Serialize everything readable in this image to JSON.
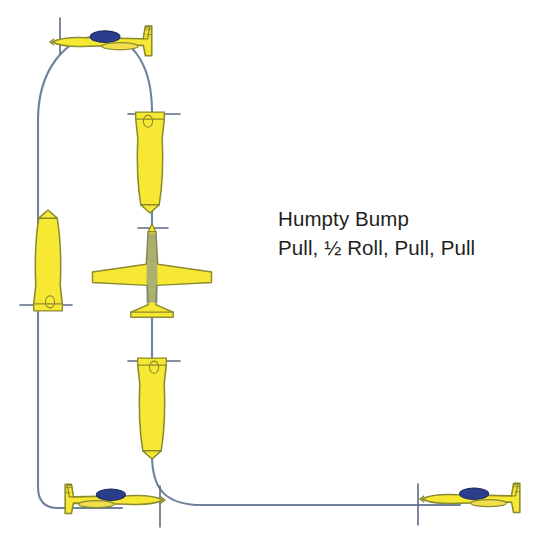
{
  "figure": {
    "colors": {
      "aircraft_body": "#F7E833",
      "aircraft_outline": "#8A8A2E",
      "canopy": "#2B3E8C",
      "flight_path": "#6E82A0",
      "tick_mark": "#5A6B84",
      "text": "#231f20",
      "background": "#ffffff"
    }
  },
  "caption": {
    "line1": "Humpty Bump",
    "line2": "Pull, ½ Roll, Pull, Pull"
  },
  "maneuver": {
    "name": "Humpty Bump",
    "sequence": [
      "Pull",
      "½ Roll",
      "Pull",
      "Pull"
    ],
    "elements": 4
  },
  "aircraft": [
    {
      "id": "entry-bottom-left",
      "position": "bottom-left",
      "attitude": "upright-level",
      "heading": "right",
      "label": "entry level flight"
    },
    {
      "id": "upline-left",
      "position": "left-vertical",
      "attitude": "vertical-up",
      "heading": "up",
      "label": "vertical upline after first pull"
    },
    {
      "id": "apex-inverted",
      "position": "top",
      "attitude": "inverted-level",
      "heading": "right",
      "label": "inverted over top of humpty"
    },
    {
      "id": "downline-upper",
      "position": "center-vertical-upper",
      "attitude": "vertical-down",
      "heading": "down",
      "label": "vertical downline before half roll"
    },
    {
      "id": "half-roll",
      "position": "center-vertical-middle",
      "attitude": "knife-edge-roll",
      "heading": "down",
      "label": "half roll on the downline"
    },
    {
      "id": "downline-lower",
      "position": "center-vertical-lower",
      "attitude": "vertical-down",
      "heading": "down",
      "label": "vertical downline after half roll"
    },
    {
      "id": "exit-right",
      "position": "bottom-right",
      "attitude": "upright-level",
      "heading": "left",
      "label": "exit level flight"
    }
  ],
  "flight_path": {
    "style": "solid thin line",
    "segments": [
      "horizontal entry at bottom left",
      "quarter-turn pull to vertical upline",
      "half loop over the top",
      "vertical downline",
      "quarter-turn pull to horizontal exit"
    ]
  }
}
